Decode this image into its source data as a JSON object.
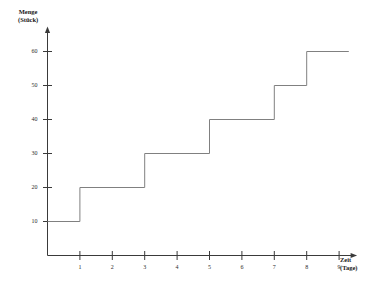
{
  "chart_data": {
    "type": "line",
    "subtype": "step",
    "title": "",
    "xlabel": "Zeit (Tage)",
    "ylabel": "Menge (Stück)",
    "ylabel_lines": [
      "Menge",
      "(Stück)"
    ],
    "xlim": [
      0,
      9.5
    ],
    "ylim": [
      0,
      65
    ],
    "grid": false,
    "legend": null,
    "x_ticks": [
      1,
      2,
      3,
      4,
      5,
      6,
      7,
      8,
      9
    ],
    "x_tick_labels": [
      "1",
      "2",
      "3",
      "4",
      "5",
      "6",
      "7",
      "8",
      "9"
    ],
    "y_ticks": [
      10,
      20,
      30,
      40,
      50,
      60
    ],
    "y_tick_labels": [
      "10",
      "20",
      "30",
      "40",
      "50",
      "60"
    ],
    "line_color": "#808080",
    "axis_color": "#3a3a3a",
    "step_points": [
      {
        "x": 0,
        "y": 10
      },
      {
        "x": 1,
        "y": 10
      },
      {
        "x": 1,
        "y": 20
      },
      {
        "x": 3,
        "y": 20
      },
      {
        "x": 3,
        "y": 30
      },
      {
        "x": 5,
        "y": 30
      },
      {
        "x": 5,
        "y": 40
      },
      {
        "x": 7,
        "y": 40
      },
      {
        "x": 7,
        "y": 50
      },
      {
        "x": 8,
        "y": 50
      },
      {
        "x": 8,
        "y": 60
      },
      {
        "x": 9.3,
        "y": 60
      }
    ],
    "steps": [
      {
        "from_x": 0,
        "to_x": 1,
        "value": 10
      },
      {
        "from_x": 1,
        "to_x": 3,
        "value": 20
      },
      {
        "from_x": 3,
        "to_x": 5,
        "value": 30
      },
      {
        "from_x": 5,
        "to_x": 7,
        "value": 40
      },
      {
        "from_x": 7,
        "to_x": 8,
        "value": 50
      },
      {
        "from_x": 8,
        "to_x": 9.3,
        "value": 60
      }
    ]
  }
}
